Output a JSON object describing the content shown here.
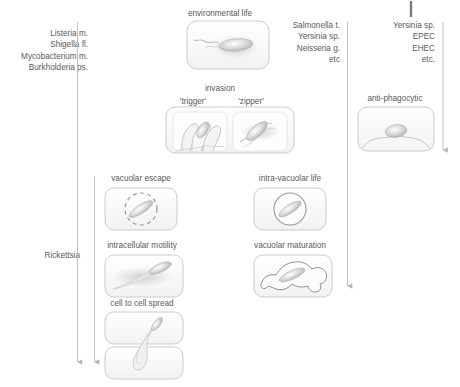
{
  "figure": {
    "background_color": "#ffffff",
    "text_color": "#5a5a5a",
    "line_color": "#b0b0b0",
    "box_stroke": "#c9c9c9",
    "box_fill": "#fbfbfb"
  },
  "groups": {
    "left": {
      "name": "cytosolic-pathogens",
      "items": [
        "Listeria m.",
        "Shigella fl.",
        "Mycobacterium m.",
        "Burkholderia ps."
      ]
    },
    "left_lower": {
      "name": "rickettsia-group",
      "items": [
        "Rickettsia"
      ]
    },
    "middle_right": {
      "name": "vacuolar-pathogens",
      "items": [
        "Salmonella t.",
        "Yersinia sp.",
        "Neisseria g.",
        "etc"
      ]
    },
    "far_right": {
      "name": "extracellular-pathogens",
      "items": [
        "Yersinia sp.",
        "EPEC",
        "EHEC",
        "etc."
      ]
    }
  },
  "stages": {
    "environmental": {
      "label": "environmental life",
      "icon": "flagellated-bacterium-icon"
    },
    "invasion": {
      "label": "invasion",
      "sublabels": [
        "'trigger'",
        "'zipper'"
      ],
      "icon_trigger": "membrane-ruffle-icon",
      "icon_zipper": "zipper-entry-icon"
    },
    "anti_phagocytic": {
      "label": "anti-phagocytic",
      "icon": "bacterium-on-cell-surface-icon"
    },
    "vacuolar_escape": {
      "label": "vacuolar escape",
      "icon": "dashed-vacuole-icon"
    },
    "intra_vacuolar": {
      "label": "intra-vacuolar life",
      "icon": "solid-vacuole-icon"
    },
    "intracellular_motility": {
      "label": "intracellular motility",
      "icon": "actin-comet-tail-icon"
    },
    "vacuolar_maturation": {
      "label": "vacuolar maturation",
      "icon": "irregular-vacuole-icon"
    },
    "cell_to_cell": {
      "label": "cell to cell spread",
      "icon": "protrusion-spread-icon"
    }
  }
}
